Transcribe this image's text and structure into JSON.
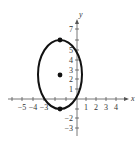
{
  "chart_data": {
    "type": "scatter",
    "title": "",
    "xlabel": "x",
    "ylabel": "y",
    "xlim": [
      -5.5,
      5
    ],
    "ylim": [
      -3.5,
      8
    ],
    "grid": false,
    "x_ticks": [
      -5,
      -4,
      -3,
      -2,
      -1,
      1,
      2,
      3,
      4
    ],
    "x_tick_labels": [
      "−5",
      "−4",
      "−3",
      "1",
      "2",
      "3",
      "4"
    ],
    "y_ticks": [
      -3,
      -2,
      -1,
      1,
      2,
      3,
      4,
      5,
      6,
      7
    ],
    "y_tick_labels": [
      "−3",
      "−2",
      "1",
      "2",
      "3",
      "4",
      "5",
      "7"
    ],
    "curve": {
      "shape": "ellipse",
      "center": [
        -1.5,
        2.5
      ],
      "semi_axis_x": 2,
      "semi_axis_y": 3.5,
      "color": "#111111"
    },
    "points": [
      {
        "label": "vertex-top",
        "x": -1.5,
        "y": 6
      },
      {
        "label": "center",
        "x": -1.5,
        "y": 2.5
      },
      {
        "label": "vertex-bottom",
        "x": -1.5,
        "y": -1
      }
    ]
  },
  "axes": {
    "x_name": "x",
    "y_name": "y",
    "x_labels": [
      {
        "text": "−5",
        "px": 22
      },
      {
        "text": "−4",
        "px": 33
      },
      {
        "text": "−3",
        "px": 44
      },
      {
        "text": "1",
        "px": 86
      },
      {
        "text": "2",
        "px": 96
      },
      {
        "text": "3",
        "px": 106
      },
      {
        "text": "4",
        "px": 116
      }
    ],
    "y_labels": [
      {
        "text": "7",
        "py": 29
      },
      {
        "text": "5",
        "py": 50
      },
      {
        "text": "4",
        "py": 60
      },
      {
        "text": "3",
        "py": 70
      },
      {
        "text": "2",
        "py": 79
      },
      {
        "text": "1",
        "py": 89
      },
      {
        "text": "−2",
        "py": 118
      },
      {
        "text": "−3",
        "py": 128
      }
    ]
  }
}
